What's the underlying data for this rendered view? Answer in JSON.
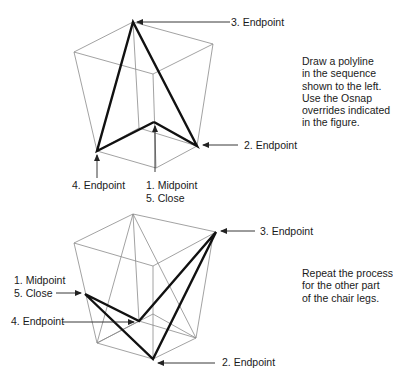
{
  "figure_top": {
    "labels": {
      "step3": "3. Endpoint",
      "step2": "2. Endpoint",
      "step4": "4. Endpoint",
      "step1": "1. Midpoint",
      "step5": "5. Close"
    },
    "instructions": [
      "Draw a polyline",
      "in the sequence",
      "shown to the left.",
      "Use the Osnap",
      "overrides indicated",
      "in the figure."
    ]
  },
  "figure_bottom": {
    "labels": {
      "step3": "3. Endpoint",
      "step1": "1. Midpoint",
      "step5": "5. Close",
      "step4": "4. Endpoint",
      "step2": "2. Endpoint"
    },
    "instructions": [
      "Repeat the process",
      "for the other part",
      "of the chair legs."
    ]
  },
  "colors": {
    "thick_line": "#111111",
    "thin_line": "#8a8a8a",
    "text": "#1a1a1a",
    "background": "#ffffff"
  }
}
